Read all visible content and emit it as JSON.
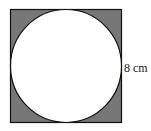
{
  "diagram": {
    "type": "circle inscribed in square",
    "square_side_label": "8 cm",
    "colors": {
      "shaded_region": "#777777",
      "circle_fill": "#ffffff",
      "stroke": "#111111"
    }
  }
}
